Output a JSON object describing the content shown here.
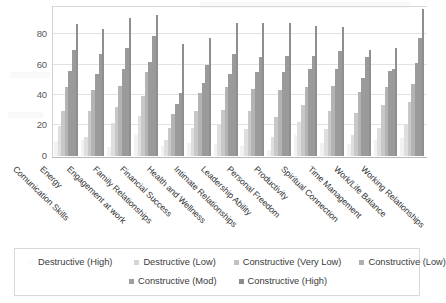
{
  "chart_data": {
    "type": "bar",
    "title": "",
    "xlabel": "",
    "ylabel": "",
    "ylim": [
      0,
      100
    ],
    "yticks": [
      0,
      20,
      40,
      60,
      80
    ],
    "grid": true,
    "legend_position": "bottom",
    "categories": [
      "Comunication Skills",
      "Energy",
      "Engagement at work",
      "Family Relationships",
      "Financial Success",
      "Health and Wellness",
      "Intimate Relationships",
      "Leadership Ability",
      "Personal Freedom",
      "Productivity",
      "Spiritual Connection",
      "Time Management",
      "Work/Life Balance",
      "Working Relationships"
    ],
    "series": [
      {
        "name": "Destructive (High)",
        "color": "#f2f2f2",
        "values": [
          10,
          11,
          6,
          14,
          7,
          9,
          8,
          7,
          4,
          14,
          9,
          8,
          11,
          12
        ]
      },
      {
        "name": "Destructive (Low)",
        "color": "#dedede",
        "values": [
          20,
          13,
          22,
          27,
          11,
          19,
          21,
          18,
          13,
          23,
          18,
          14,
          19,
          21
        ]
      },
      {
        "name": "Constructive (Very Low)",
        "color": "#c8c8c8",
        "values": [
          30,
          30,
          33,
          40,
          19,
          30,
          31,
          30,
          26,
          34,
          30,
          29,
          34,
          36
        ]
      },
      {
        "name": "Constructive (Low)",
        "color": "#b4b4b4",
        "values": [
          46,
          44,
          47,
          56,
          28,
          42,
          46,
          45,
          44,
          46,
          47,
          43,
          46,
          48
        ]
      },
      {
        "name": "Constructive (Mod)",
        "color": "#9b9b9b",
        "values": [
          57,
          55,
          58,
          63,
          35,
          49,
          55,
          56,
          56,
          58,
          58,
          52,
          57,
          62
        ]
      },
      {
        "name": "Constructive (High)",
        "color": "#9a9a9a",
        "values": [
          71,
          68,
          72,
          80,
          42,
          61,
          68,
          66,
          67,
          67,
          70,
          66,
          58,
          79
        ]
      },
      {
        "name": "Peak",
        "color": "#8f8f8f",
        "values": [
          88,
          85,
          92,
          94,
          75,
          79,
          89,
          89,
          89,
          87,
          86,
          71,
          72,
          98
        ]
      }
    ]
  },
  "legend": {
    "row1": [
      {
        "label": "Destructive (High)",
        "color": "#fcfcfc"
      },
      {
        "label": "Destructive (Low)",
        "color": "#d6d6d6"
      },
      {
        "label": "Constructive (Very Low)",
        "color": "#c2c2c2"
      },
      {
        "label": "Constructive (Low)",
        "color": "#b0b0b0"
      }
    ],
    "row2": [
      {
        "label": "Constructive (Mod)",
        "color": "#a0a0a0"
      },
      {
        "label": "Constructive (High)",
        "color": "#8c8c8c"
      }
    ]
  }
}
